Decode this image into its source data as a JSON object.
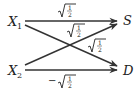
{
  "diagram": {
    "type": "signal-flow / beam-splitter network",
    "inputs": [
      {
        "id": "X1",
        "label": "X",
        "subscript": "1"
      },
      {
        "id": "X2",
        "label": "X",
        "subscript": "2"
      }
    ],
    "outputs": [
      {
        "id": "S",
        "label": "S"
      },
      {
        "id": "D",
        "label": "D"
      }
    ],
    "edges": [
      {
        "from": "X1",
        "to": "S",
        "weight": "√(1/2)",
        "sign": "",
        "num": "1",
        "den": "2"
      },
      {
        "from": "X2",
        "to": "S",
        "weight": "√(1/2)",
        "sign": "",
        "num": "1",
        "den": "2"
      },
      {
        "from": "X1",
        "to": "D",
        "weight": "√(1/2)",
        "sign": "",
        "num": "1",
        "den": "2"
      },
      {
        "from": "X2",
        "to": "D",
        "weight": "−√(1/2)",
        "sign": "−",
        "num": "1",
        "den": "2"
      }
    ],
    "colors": {
      "ink": "#222222",
      "edge": "#333333",
      "background": "#ffffff"
    }
  }
}
